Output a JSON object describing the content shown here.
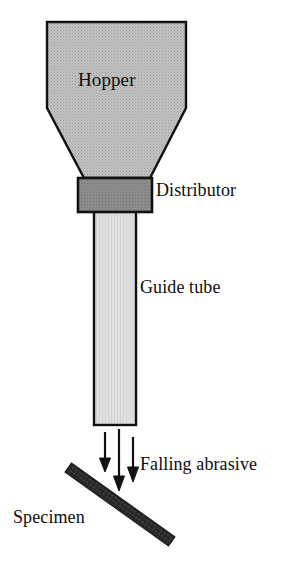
{
  "figure": {
    "background_color": "#ffffff",
    "width": 293,
    "height": 587
  },
  "labels": {
    "hopper": "Hopper",
    "distributor": "Distributor",
    "guide_tube": "Guide tube",
    "falling_abrasive": "Falling abrasive",
    "specimen": "Specimen"
  },
  "colors": {
    "hopper_fill": "#b9b9b9",
    "distributor_fill": "#8a8a8a",
    "guide_tube_fill": "#dcdcdc",
    "specimen_fill": "#2b2b2b",
    "outline": "#111111",
    "arrow": "#111111",
    "text": "#0d0d0d"
  },
  "parts": [
    {
      "name": "hopper",
      "shape": "funnel",
      "fill": "#b9b9b9",
      "texture": "stippled",
      "points": "47,22 186,22 186,108 150,178 84,178 47,108"
    },
    {
      "name": "distributor",
      "shape": "rectangle",
      "fill": "#8a8a8a",
      "x": 78,
      "y": 178,
      "width": 74,
      "height": 34
    },
    {
      "name": "guide-tube",
      "shape": "rectangle",
      "fill": "#dcdcdc",
      "x": 94,
      "y": 212,
      "width": 42,
      "height": 213
    },
    {
      "name": "specimen",
      "shape": "diagonal-bar",
      "fill": "#2b2b2b",
      "x1": 68,
      "y1": 468,
      "x2": 171,
      "y2": 541,
      "thickness": 11
    }
  ],
  "arrows": [
    {
      "name": "arrow-left",
      "x": 105,
      "y_start": 432,
      "y_end": 471
    },
    {
      "name": "arrow-middle",
      "x": 119,
      "y_start": 429,
      "y_end": 490
    },
    {
      "name": "arrow-right",
      "x": 133,
      "y_start": 437,
      "y_end": 481
    }
  ]
}
